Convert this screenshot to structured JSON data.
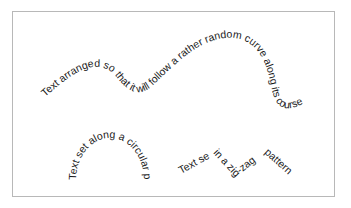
{
  "figure": {
    "frame_border_color": "#b8b8b8",
    "text_color": "#1a1a1a",
    "samples": [
      {
        "id": "wavy",
        "label": "Text arranged so that it will follow a rather random curve along its course",
        "path_type": "random-curve"
      },
      {
        "id": "circular",
        "label": "Text set along a circular path",
        "path_type": "circular-arc"
      },
      {
        "id": "zigzag",
        "segments": [
          "Text set",
          "in a zig",
          "-zag",
          "pattern"
        ],
        "path_type": "zig-zag"
      }
    ]
  }
}
